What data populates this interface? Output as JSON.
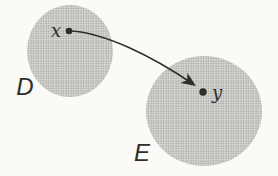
{
  "figure": {
    "type": "set-mapping-diagram",
    "arrow": {
      "from": "x",
      "to": "y"
    }
  },
  "labels": {
    "set_d": "D",
    "set_e": "E",
    "point_x": "x",
    "point_y": "y"
  },
  "colors": {
    "background": "#fbfaf7",
    "stipple_base": "#d8d7d4",
    "stipple_dot": "#a6a5a2",
    "ink": "#2e2d2b"
  }
}
